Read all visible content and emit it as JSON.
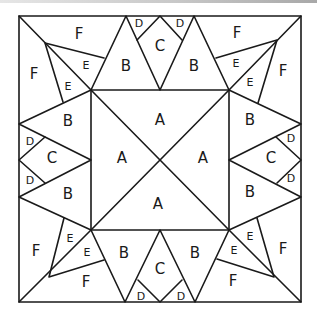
{
  "diagram": {
    "type": "quilt-block-pattern",
    "piece_labels": [
      "A",
      "B",
      "C",
      "D",
      "E",
      "F"
    ],
    "labels": {
      "center": [
        "A",
        "A",
        "A",
        "A"
      ],
      "top": {
        "b_left": "B",
        "c": "C",
        "b_right": "B",
        "d_left": "D",
        "d_right": "D"
      },
      "bottom": {
        "b_left": "B",
        "c": "C",
        "b_right": "B",
        "d_left": "D",
        "d_right": "D"
      },
      "left": {
        "b_top": "B",
        "c": "C",
        "b_bottom": "B",
        "d_top": "D",
        "d_bottom": "D"
      },
      "right": {
        "b_top": "B",
        "c": "C",
        "b_bottom": "B",
        "d_top": "D",
        "d_bottom": "D"
      },
      "corner_tl": {
        "f_top": "F",
        "f_side": "F",
        "e_upper": "E",
        "e_lower": "E"
      },
      "corner_tr": {
        "f_top": "F",
        "f_side": "F",
        "e_upper": "E",
        "e_lower": "E"
      },
      "corner_bl": {
        "f_bottom": "F",
        "f_side": "F",
        "e_upper": "E",
        "e_lower": "E"
      },
      "corner_br": {
        "f_bottom": "F",
        "f_side": "F",
        "e_upper": "E",
        "e_lower": "E"
      }
    },
    "colors": {
      "line": "#1a1a1a",
      "background": "#ffffff"
    }
  }
}
